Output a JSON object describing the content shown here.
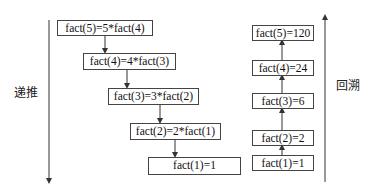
{
  "recursion": {
    "label": "递推",
    "steps": [
      "fact(5)=5*fact(4)",
      "fact(4)=4*fact(3)",
      "fact(3)=3*fact(2)",
      "fact(2)=2*fact(1)",
      "fact(1)=1"
    ]
  },
  "backtrack": {
    "label": "回溯",
    "steps": [
      "fact(5)=120",
      "fact(4)=24",
      "fact(3)=6",
      "fact(2)=2",
      "fact(1)=1"
    ]
  }
}
